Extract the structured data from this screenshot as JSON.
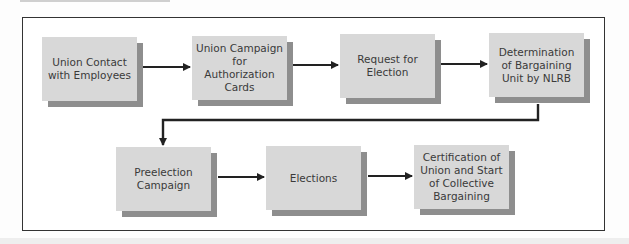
{
  "diagram": {
    "type": "flowchart",
    "title": "",
    "steps": [
      {
        "id": "step1",
        "label": "Union Contact with Employees"
      },
      {
        "id": "step2",
        "label": "Union Campaign for Authorization Cards"
      },
      {
        "id": "step3",
        "label": "Request for Election"
      },
      {
        "id": "step4",
        "label": "Determination of Bargaining Unit by NLRB"
      },
      {
        "id": "step5",
        "label": "Preelection Campaign"
      },
      {
        "id": "step6",
        "label": "Elections"
      },
      {
        "id": "step7",
        "label": "Certification of Union and Start of Collective Bargaining"
      }
    ],
    "edges": [
      {
        "from": "step1",
        "to": "step2"
      },
      {
        "from": "step2",
        "to": "step3"
      },
      {
        "from": "step3",
        "to": "step4"
      },
      {
        "from": "step4",
        "to": "step5"
      },
      {
        "from": "step5",
        "to": "step6"
      },
      {
        "from": "step6",
        "to": "step7"
      }
    ],
    "colors": {
      "box_fill": "#d8d8d8",
      "box_shadow": "#8e8e8e",
      "arrow": "#222222",
      "frame": "#333333",
      "text": "#3a3a3a"
    }
  }
}
